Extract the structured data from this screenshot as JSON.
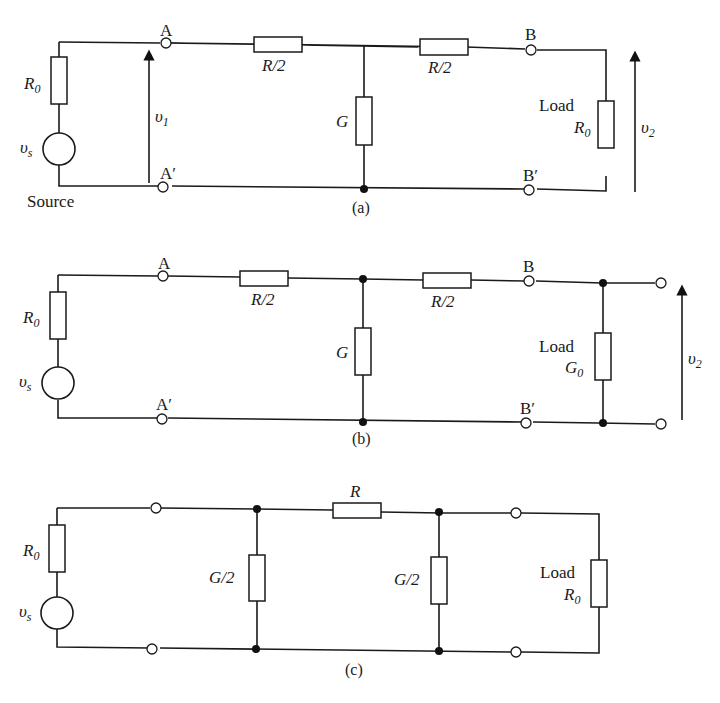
{
  "figure": {
    "panels": [
      {
        "id": "a",
        "caption": "(a)",
        "source_label": "Source",
        "source_resistor": {
          "symbol": "R",
          "sub": "0"
        },
        "source_voltage": {
          "symbol": "υ",
          "sub": "s"
        },
        "terminals": {
          "top_left": "A",
          "bottom_left": "A′",
          "top_right": "B",
          "bottom_right": "B′"
        },
        "series_left": "R/2",
        "shunt": "G",
        "series_right": "R/2",
        "load_label": "Load",
        "load_element": {
          "symbol": "R",
          "sub": "0"
        },
        "input_voltage": {
          "symbol": "υ",
          "sub": "1"
        },
        "output_voltage": {
          "symbol": "υ",
          "sub": "2"
        }
      },
      {
        "id": "b",
        "caption": "(b)",
        "source_resistor": {
          "symbol": "R",
          "sub": "0"
        },
        "source_voltage": {
          "symbol": "υ",
          "sub": "s"
        },
        "terminals": {
          "top_left": "A",
          "bottom_left": "A′",
          "top_right": "B",
          "bottom_right": "B′"
        },
        "series_left": "R/2",
        "shunt": "G",
        "series_right": "R/2",
        "load_label": "Load",
        "load_element": {
          "symbol": "G",
          "sub": "0"
        },
        "output_voltage": {
          "symbol": "υ",
          "sub": "2"
        }
      },
      {
        "id": "c",
        "caption": "(c)",
        "source_resistor": {
          "symbol": "R",
          "sub": "0"
        },
        "source_voltage": {
          "symbol": "υ",
          "sub": "s"
        },
        "shunt_left": "G/2",
        "series": "R",
        "shunt_right": "G/2",
        "load_label": "Load",
        "load_element": {
          "symbol": "R",
          "sub": "0"
        }
      }
    ]
  }
}
